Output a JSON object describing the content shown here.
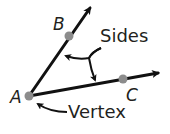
{
  "diagram": {
    "colors": {
      "line": "#111111",
      "point": "#8c8c8c",
      "text": "#231f20",
      "background": "#ffffff"
    },
    "points": {
      "A": {
        "label": "A",
        "x": 29,
        "y": 96
      },
      "B": {
        "label": "B",
        "x": 69,
        "y": 36
      },
      "C": {
        "label": "C",
        "x": 123,
        "y": 79
      }
    },
    "rays": [
      {
        "name": "ray-AB",
        "from": "A",
        "through": "B",
        "end": [
          93,
          4
        ]
      },
      {
        "name": "ray-AC",
        "from": "A",
        "through": "C",
        "end": [
          163,
          72
        ]
      }
    ],
    "annotations": {
      "sides": {
        "label": "Sides",
        "points_to": [
          "ray-AB",
          "ray-AC"
        ]
      },
      "vertex": {
        "label": "Vertex",
        "points_to": "A"
      }
    }
  }
}
